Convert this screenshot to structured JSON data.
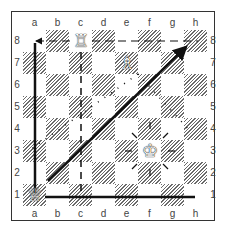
{
  "diagram": {
    "type": "chess-board",
    "files": [
      "a",
      "b",
      "c",
      "d",
      "e",
      "f",
      "g",
      "h"
    ],
    "ranks": [
      "8",
      "7",
      "6",
      "5",
      "4",
      "3",
      "2",
      "1"
    ],
    "pieces": [
      {
        "name": "white-rook",
        "square": "c8",
        "glyph": "♖"
      },
      {
        "name": "white-bishop",
        "square": "e7",
        "glyph": "♗"
      },
      {
        "name": "white-king",
        "square": "f3",
        "glyph": "♔"
      },
      {
        "name": "white-queen",
        "square": "a1",
        "glyph": "♕"
      }
    ],
    "arrows": [
      {
        "from": "a1",
        "to": "a8",
        "style": "solid"
      },
      {
        "from": "a1",
        "to": "h1",
        "style": "solid"
      },
      {
        "from": "b2",
        "to": "h8",
        "style": "solid-arrow"
      },
      {
        "from": "c8",
        "to": "c1",
        "style": "dashed"
      },
      {
        "from": "c8",
        "to": "a8",
        "style": "dashed-arrow"
      },
      {
        "from": "c8",
        "to": "h8",
        "style": "dashed"
      },
      {
        "from": "e7",
        "to": "a3",
        "style": "dotted"
      },
      {
        "from": "e7",
        "to": "h4",
        "style": "dotted"
      }
    ]
  }
}
